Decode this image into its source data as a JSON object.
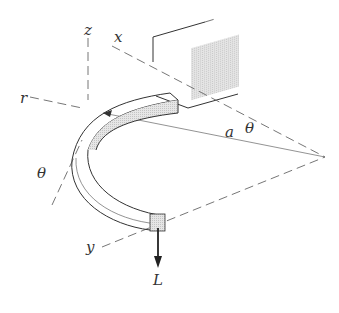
{
  "figure": {
    "labels": {
      "z": "z",
      "x": "x",
      "r": "r",
      "theta_left": "θ",
      "a": "a",
      "theta_right": "θ",
      "y": "y",
      "L": "L"
    },
    "colors": {
      "line": "#333333",
      "dash": "#666666",
      "shade": "#d8d8d8",
      "background": "#ffffff"
    }
  }
}
